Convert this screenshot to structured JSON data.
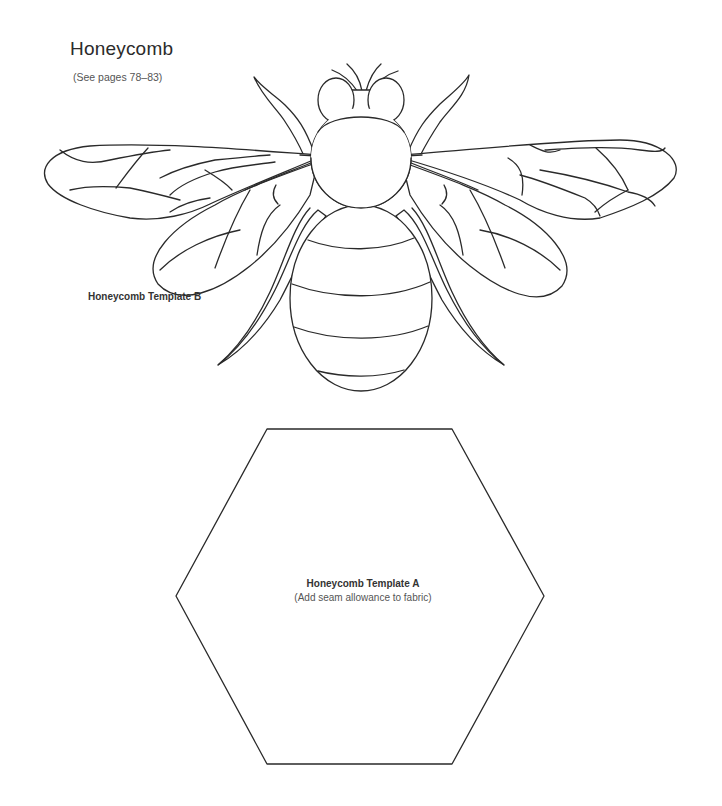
{
  "page": {
    "title": "Honeycomb",
    "subtitle": "(See pages 78–83)"
  },
  "templates": {
    "b": {
      "label": "Honeycomb Template B",
      "shape": "bee"
    },
    "a": {
      "label": "Honeycomb Template A",
      "note": "(Add seam allowance to fabric)",
      "shape": "hexagon"
    }
  },
  "colors": {
    "line": "#2a2a2a",
    "background": "#ffffff",
    "text": "#333333"
  }
}
